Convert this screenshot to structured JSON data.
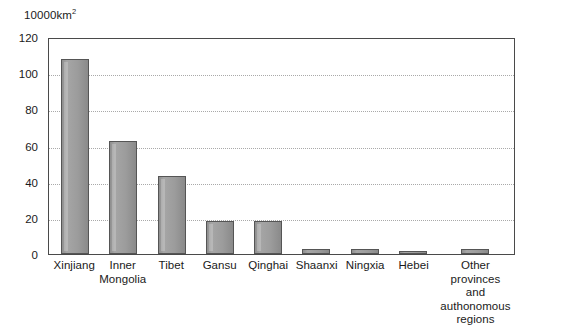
{
  "chart_data": {
    "type": "bar",
    "title": "",
    "xlabel": "",
    "ylabel": "10000km2",
    "unit_label_main": "10000km",
    "unit_label_sup": "2",
    "ylim": [
      0,
      120
    ],
    "yticks": [
      120,
      100,
      80,
      60,
      40,
      20,
      0
    ],
    "grid": "horizontal-dotted",
    "legend": "none",
    "categories": [
      "Xinjiang",
      "Inner\nMongolia",
      "Tibet",
      "Gansu",
      "Qinghai",
      "Shaanxi",
      "Ningxia",
      "Hebei",
      "Other provinces\nand authonomous\nregions"
    ],
    "values": [
      108,
      62.5,
      43,
      18.5,
      18.5,
      2.5,
      2.5,
      1.5,
      3
    ],
    "bars": [
      {
        "label": "Xinjiang",
        "value": 108,
        "wide": false
      },
      {
        "label": "Inner\nMongolia",
        "value": 62.5,
        "wide": false
      },
      {
        "label": "Tibet",
        "value": 43,
        "wide": false
      },
      {
        "label": "Gansu",
        "value": 18.5,
        "wide": false
      },
      {
        "label": "Qinghai",
        "value": 18.5,
        "wide": false
      },
      {
        "label": "Shaanxi",
        "value": 2.5,
        "wide": false
      },
      {
        "label": "Ningxia",
        "value": 2.5,
        "wide": false
      },
      {
        "label": "Hebei",
        "value": 1.5,
        "wide": false
      },
      {
        "label": "Other provinces\nand authonomous\nregions",
        "value": 3,
        "wide": true
      }
    ],
    "colors": {
      "bar_fill": "#9c9c9c",
      "bar_border": "#555555",
      "axis": "#4a4a4a",
      "gridline": "#a9a9a9",
      "text": "#1a1a1a",
      "background": "#ffffff"
    }
  }
}
